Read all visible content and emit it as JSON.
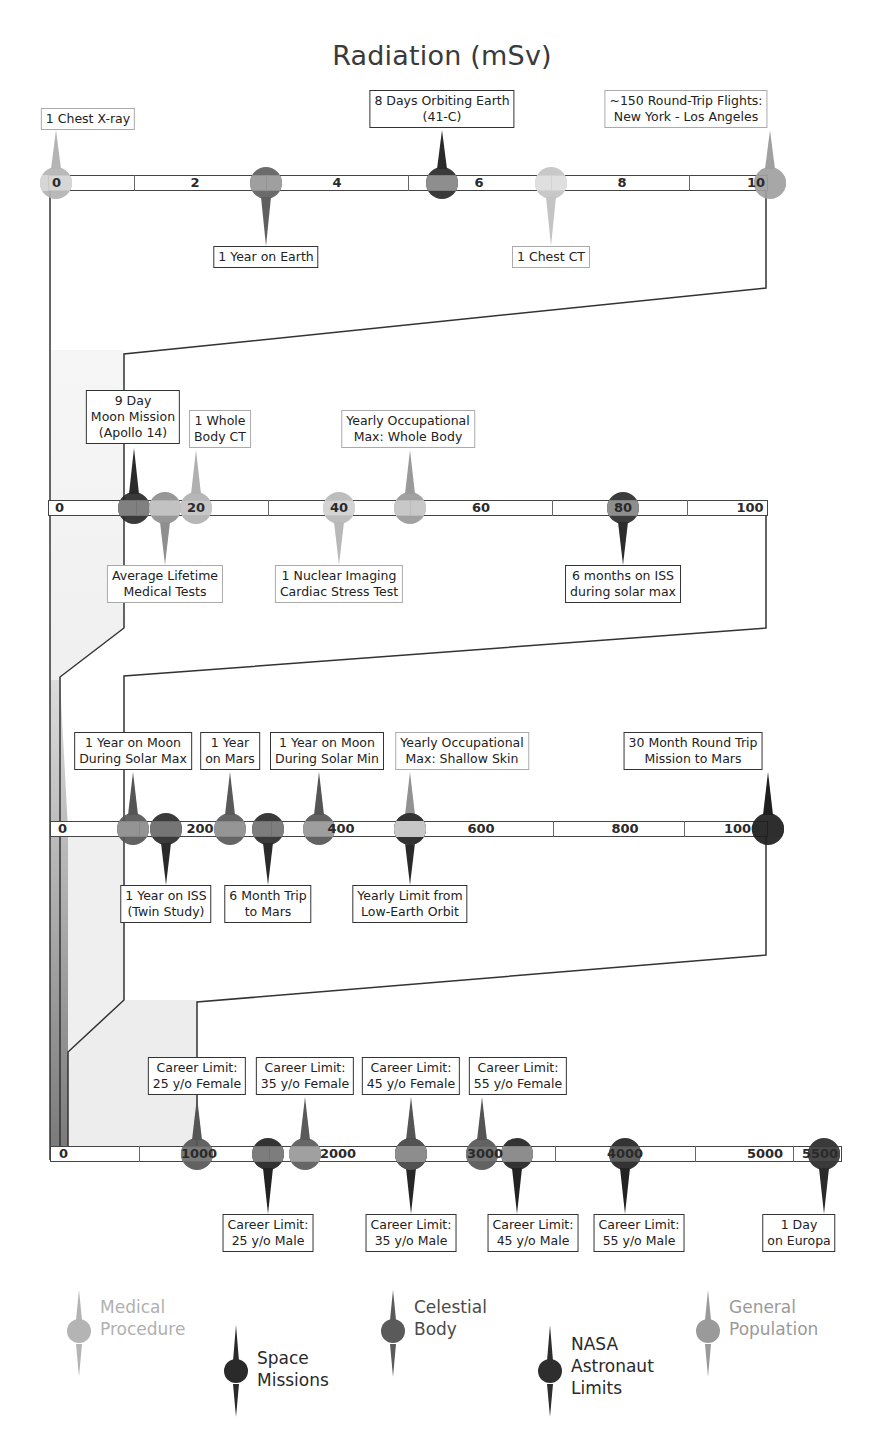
{
  "title": "Radiation (mSv)",
  "colors": {
    "medical": "#b4b4b4",
    "space": "#2a2a2a",
    "celestial": "#5f5f5f",
    "nasa": "#2e2e2e",
    "general": "#9a9a9a",
    "axis_fill": "#ffffff",
    "shade": "#ececec"
  },
  "legend": [
    {
      "key": "medical",
      "label_line1": "Medical",
      "label_line2": "Procedure",
      "label_line3": ""
    },
    {
      "key": "space",
      "label_line1": "Space",
      "label_line2": "Missions",
      "label_line3": ""
    },
    {
      "key": "celestial",
      "label_line1": "Celestial",
      "label_line2": "Body",
      "label_line3": ""
    },
    {
      "key": "nasa",
      "label_line1": "NASA",
      "label_line2": "Astronaut",
      "label_line3": "Limits"
    },
    {
      "key": "general",
      "label_line1": "General",
      "label_line2": "Population",
      "label_line3": ""
    }
  ],
  "chart_data": {
    "type": "timeline",
    "title": "Radiation (mSv)",
    "unit": "mSv",
    "rows": [
      {
        "range": [
          0,
          10
        ],
        "ticks": [
          "0",
          "2",
          "4",
          "6",
          "8",
          "10"
        ],
        "events": [
          {
            "label": "1 Chest X-ray",
            "value": 0.1,
            "category": "medical",
            "side": "above"
          },
          {
            "label": "1 Year on Earth",
            "value": 3,
            "category": "celestial",
            "side": "below"
          },
          {
            "label": "8 Days Orbiting Earth (41-C)",
            "value": 5.6,
            "category": "space",
            "side": "above"
          },
          {
            "label": "1 Chest CT",
            "value": 7,
            "category": "medical",
            "side": "below"
          },
          {
            "label": "~150 Round-Trip Flights: New York - Los Angeles",
            "value": 10,
            "category": "general",
            "side": "above"
          }
        ]
      },
      {
        "range": [
          0,
          100
        ],
        "ticks": [
          "0",
          "20",
          "40",
          "60",
          "80",
          "100"
        ],
        "events": [
          {
            "label": "9 Day Moon Mission (Apollo 14)",
            "value": 11,
            "category": "space",
            "side": "above"
          },
          {
            "label": "Average Lifetime Medical Tests",
            "value": 15,
            "category": "medical",
            "side": "below"
          },
          {
            "label": "1 Whole Body CT",
            "value": 20,
            "category": "medical",
            "side": "above"
          },
          {
            "label": "1 Nuclear Imaging Cardiac Stress Test",
            "value": 40,
            "category": "medical",
            "side": "below"
          },
          {
            "label": "Yearly Occupational Max: Whole Body",
            "value": 50,
            "category": "general",
            "side": "above"
          },
          {
            "label": "6 months on ISS during solar max",
            "value": 80,
            "category": "space",
            "side": "below"
          }
        ]
      },
      {
        "range": [
          0,
          1000
        ],
        "ticks": [
          "0",
          "200",
          "400",
          "600",
          "800",
          "1000"
        ],
        "events": [
          {
            "label": "1 Year on Moon During Solar Max",
            "value": 110,
            "category": "celestial",
            "side": "above"
          },
          {
            "label": "1 Year on ISS (Twin Study)",
            "value": 146,
            "category": "space",
            "side": "below"
          },
          {
            "label": "1 Year on Mars",
            "value": 232,
            "category": "celestial",
            "side": "above"
          },
          {
            "label": "6 Month Trip to Mars",
            "value": 300,
            "category": "space",
            "side": "below"
          },
          {
            "label": "1 Year on Moon During Solar Min",
            "value": 380,
            "category": "celestial",
            "side": "above"
          },
          {
            "label": "Yearly Occupational Max: Shallow Skin",
            "value": 500,
            "category": "general",
            "side": "above"
          },
          {
            "label": "Yearly Limit from Low-Earth Orbit",
            "value": 500,
            "category": "nasa",
            "side": "below"
          },
          {
            "label": "30 Month Round Trip Mission to Mars",
            "value": 1000,
            "category": "space",
            "side": "above"
          }
        ]
      },
      {
        "range": [
          0,
          5500
        ],
        "ticks": [
          "0",
          "1000",
          "2000",
          "3000",
          "4000",
          "5000",
          "5500"
        ],
        "events": [
          {
            "label": "Career Limit: 25 y/o Female",
            "value": 1000,
            "category": "nasa",
            "side": "above"
          },
          {
            "label": "Career Limit: 25 y/o Male",
            "value": 1500,
            "category": "nasa",
            "side": "below"
          },
          {
            "label": "Career Limit: 35 y/o Female",
            "value": 1750,
            "category": "nasa",
            "side": "above"
          },
          {
            "label": "Career Limit: 35 y/o Male",
            "value": 2500,
            "category": "nasa",
            "side": "below"
          },
          {
            "label": "Career Limit: 45 y/o Female",
            "value": 2500,
            "category": "nasa",
            "side": "above"
          },
          {
            "label": "Career Limit: 55 y/o Female",
            "value": 3000,
            "category": "nasa",
            "side": "above"
          },
          {
            "label": "Career Limit: 45 y/o Male",
            "value": 3250,
            "category": "nasa",
            "side": "below"
          },
          {
            "label": "Career Limit: 55 y/o Male",
            "value": 4000,
            "category": "nasa",
            "side": "below"
          },
          {
            "label": "1 Day on Europa",
            "value": 5400,
            "category": "celestial",
            "side": "below"
          }
        ]
      }
    ],
    "legend": [
      "Medical Procedure",
      "Space Missions",
      "Celestial Body",
      "NASA Astronaut Limits",
      "General Population"
    ]
  },
  "rows_ui": [
    {
      "ticks": [
        {
          "text": "0",
          "x": 52
        },
        {
          "text": "2",
          "x": 195
        },
        {
          "text": "4",
          "x": 337
        },
        {
          "text": "6",
          "x": 479
        },
        {
          "text": "8",
          "x": 622
        },
        {
          "text": "10",
          "x": 756
        }
      ],
      "events": [
        {
          "id": "chest-xray",
          "l1": "1 Chest X-ray",
          "l2": "",
          "x": 56,
          "side": "above",
          "labx": 88,
          "laby": 108,
          "cat": "medical",
          "fill": "#b4b4b4",
          "band": "#d5d5d5"
        },
        {
          "id": "year-earth",
          "l1": "1 Year on Earth",
          "l2": "",
          "x": 266,
          "side": "below",
          "labx": 266,
          "laby": 246,
          "cat": "celestial",
          "fill": "#5f5f5f",
          "band": "#9a9a9a"
        },
        {
          "id": "days-orbit",
          "l1": "8 Days Orbiting Earth",
          "l2": "(41-C)",
          "x": 442,
          "side": "above",
          "labx": 442,
          "laby": 90,
          "cat": "space",
          "fill": "#2a2a2a",
          "band": "#8a8a8a"
        },
        {
          "id": "chest-ct",
          "l1": "1 Chest CT",
          "l2": "",
          "x": 551,
          "side": "below",
          "labx": 551,
          "laby": 246,
          "cat": "medical",
          "fill": "#c4c4c4",
          "band": "#dedede"
        },
        {
          "id": "flights",
          "l1": "~150 Round-Trip Flights:",
          "l2": "New York - Los Angeles",
          "x": 770,
          "side": "above",
          "labx": 686,
          "laby": 90,
          "cat": "general",
          "fill": "#a0a0a0",
          "band": "#a0a0a0"
        }
      ]
    },
    {
      "ticks": [
        {
          "text": "0",
          "x": 55
        },
        {
          "text": "20",
          "x": 196
        },
        {
          "text": "40",
          "x": 339
        },
        {
          "text": "60",
          "x": 481
        },
        {
          "text": "80",
          "x": 623
        },
        {
          "text": "100",
          "x": 750
        }
      ],
      "events": [
        {
          "id": "apollo14",
          "l1": "9 Day",
          "l2": "Moon Mission",
          "l3": "(Apollo 14)",
          "x": 134,
          "side": "above",
          "labx": 133,
          "laby": 390,
          "cat": "space",
          "fill": "#2a2a2a",
          "band": "#7a7a7a"
        },
        {
          "id": "lifetime-med",
          "l1": "Average Lifetime",
          "l2": "Medical Tests",
          "x": 165,
          "side": "below",
          "labx": 165,
          "laby": 565,
          "cat": "medical",
          "fill": "#8f8f8f",
          "band": "#c0c0c0"
        },
        {
          "id": "whole-ct",
          "l1": "1 Whole",
          "l2": "Body CT",
          "x": 196,
          "side": "above",
          "labx": 220,
          "laby": 410,
          "cat": "medical",
          "fill": "#b0b0b0",
          "band": "#c4c4c4"
        },
        {
          "id": "cardiac",
          "l1": "1 Nuclear Imaging",
          "l2": "Cardiac Stress Test",
          "x": 339,
          "side": "below",
          "labx": 339,
          "laby": 565,
          "cat": "medical",
          "fill": "#b8b8b8",
          "band": "#d2d2d2"
        },
        {
          "id": "occ-whole",
          "l1": "Yearly Occupational",
          "l2": "Max: Whole Body",
          "x": 410,
          "side": "above",
          "labx": 408,
          "laby": 410,
          "cat": "general",
          "fill": "#9a9a9a",
          "band": "#c6c6c6"
        },
        {
          "id": "iss-solar",
          "l1": "6 months on ISS",
          "l2": "during solar max",
          "x": 623,
          "side": "below",
          "labx": 623,
          "laby": 565,
          "cat": "space",
          "fill": "#2c2c2c",
          "band": "#8a8a8a"
        }
      ]
    },
    {
      "ticks": [
        {
          "text": "0",
          "x": 58
        },
        {
          "text": "200",
          "x": 200
        },
        {
          "text": "400",
          "x": 341
        },
        {
          "text": "600",
          "x": 481
        },
        {
          "text": "800",
          "x": 625
        },
        {
          "text": "1000",
          "x": 742
        }
      ],
      "events": [
        {
          "id": "moon-max",
          "l1": "1 Year on Moon",
          "l2": "During Solar Max",
          "x": 133,
          "side": "above",
          "labx": 133,
          "laby": 732,
          "cat": "celestial",
          "fill": "#555555",
          "band": "#8e8e8e"
        },
        {
          "id": "iss-twin",
          "l1": "1 Year on ISS",
          "l2": "(Twin Study)",
          "x": 166,
          "side": "below",
          "labx": 166,
          "laby": 885,
          "cat": "space",
          "fill": "#2a2a2a",
          "band": "#6e6e6e"
        },
        {
          "id": "mars-year",
          "l1": "1 Year",
          "l2": "on Mars",
          "x": 230,
          "side": "above",
          "labx": 230,
          "laby": 732,
          "cat": "celestial",
          "fill": "#595959",
          "band": "#909090"
        },
        {
          "id": "trip-mars",
          "l1": "6 Month Trip",
          "l2": "to Mars",
          "x": 268,
          "side": "below",
          "labx": 268,
          "laby": 885,
          "cat": "space",
          "fill": "#2a2a2a",
          "band": "#777777"
        },
        {
          "id": "moon-min",
          "l1": "1 Year on Moon",
          "l2": "During Solar Min",
          "x": 319,
          "side": "above",
          "labx": 327,
          "laby": 732,
          "cat": "celestial",
          "fill": "#555555",
          "band": "#9a9a9a"
        },
        {
          "id": "occ-skin",
          "l1": "Yearly Occupational",
          "l2": "Max: Shallow Skin",
          "x": 410,
          "side": "above",
          "labx": 462,
          "laby": 732,
          "cat": "general",
          "fill": "#929292",
          "band": "#c6c6c6"
        },
        {
          "id": "leo-limit",
          "l1": "Yearly Limit from",
          "l2": "Low-Earth Orbit",
          "x": 410,
          "side": "below",
          "labx": 410,
          "laby": 885,
          "cat": "nasa",
          "fill": "#2a2a2a",
          "band": "#d0d0d0",
          "split": true
        },
        {
          "id": "mars-30",
          "l1": "30 Month Round Trip",
          "l2": "Mission to Mars",
          "x": 768,
          "side": "above",
          "labx": 693,
          "laby": 732,
          "cat": "space",
          "fill": "#1e1e1e",
          "band": "#1e1e1e"
        }
      ]
    },
    {
      "ticks": [
        {
          "text": "0",
          "x": 59
        },
        {
          "text": "1000",
          "x": 199
        },
        {
          "text": "2000",
          "x": 338
        },
        {
          "text": "3000",
          "x": 485
        },
        {
          "text": "4000",
          "x": 625
        },
        {
          "text": "5000",
          "x": 765
        },
        {
          "text": "5500",
          "x": 820
        }
      ],
      "events": [
        {
          "id": "f25",
          "l1": "Career Limit:",
          "l2": "25 y/o Female",
          "x": 197,
          "side": "above",
          "labx": 197,
          "laby": 1057,
          "cat": "nasa",
          "fill": "#555555",
          "band": "#707070"
        },
        {
          "id": "m25",
          "l1": "Career Limit:",
          "l2": "25 y/o Male",
          "x": 268,
          "side": "below",
          "labx": 268,
          "laby": 1214,
          "cat": "nasa",
          "fill": "#222222",
          "band": "#777777"
        },
        {
          "id": "f35",
          "l1": "Career Limit:",
          "l2": "35 y/o Female",
          "x": 305,
          "side": "above",
          "labx": 305,
          "laby": 1057,
          "cat": "nasa",
          "fill": "#5a5a5a",
          "band": "#9c9c9c"
        },
        {
          "id": "m35",
          "l1": "Career Limit:",
          "l2": "35 y/o Male",
          "x": 411,
          "side": "below",
          "labx": 411,
          "laby": 1214,
          "cat": "nasa",
          "fill": "#262626",
          "band": "#aaaaaa",
          "split": true
        },
        {
          "id": "f45",
          "l1": "Career Limit:",
          "l2": "45 y/o Female",
          "x": 411,
          "side": "above",
          "labx": 411,
          "laby": 1057,
          "cat": "nasa",
          "fill": "#555555",
          "band": "#8e8e8e"
        },
        {
          "id": "f55",
          "l1": "Career Limit:",
          "l2": "55 y/o Female",
          "x": 482,
          "side": "above",
          "labx": 518,
          "laby": 1057,
          "cat": "nasa",
          "fill": "#555555",
          "band": "#6a6a6a"
        },
        {
          "id": "m45",
          "l1": "Career Limit:",
          "l2": "45 y/o Male",
          "x": 517,
          "side": "below",
          "labx": 533,
          "laby": 1214,
          "cat": "nasa",
          "fill": "#222222",
          "band": "#8a8a8a"
        },
        {
          "id": "m55",
          "l1": "Career Limit:",
          "l2": "55 y/o Male",
          "x": 625,
          "side": "below",
          "labx": 639,
          "laby": 1214,
          "cat": "nasa",
          "fill": "#222222",
          "band": "#555555"
        },
        {
          "id": "europa",
          "l1": "1 Day",
          "l2": "on Europa",
          "x": 824,
          "side": "below",
          "labx": 799,
          "laby": 1214,
          "cat": "celestial",
          "fill": "#2a2a2a",
          "band": "#3a3a3a"
        }
      ]
    }
  ]
}
